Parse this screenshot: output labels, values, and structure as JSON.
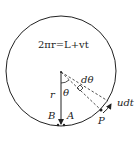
{
  "diagram": {
    "equation": "2πr=L+vt",
    "labels": {
      "r": "r",
      "theta": "θ",
      "dtheta": "dθ",
      "B": "B",
      "A": "A",
      "P": "P",
      "udt": "udt"
    },
    "colors": {
      "stroke": "#222222",
      "background": "#ffffff"
    }
  }
}
